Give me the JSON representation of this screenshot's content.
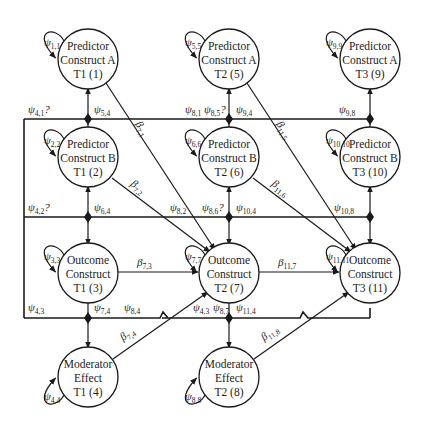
{
  "nodes": [
    {
      "id": 1,
      "lines": [
        "Predictor",
        "Construct A",
        "T1 (1)"
      ],
      "var": "1,1"
    },
    {
      "id": 5,
      "lines": [
        "Predictor",
        "Construct A",
        "T2 (5)"
      ],
      "var": "5,5"
    },
    {
      "id": 9,
      "lines": [
        "Predictor",
        "Construct A",
        "T3 (9)"
      ],
      "var": "9,9"
    },
    {
      "id": 2,
      "lines": [
        "Predictor",
        "Construct B",
        "T1 (2)"
      ],
      "var": "2,2"
    },
    {
      "id": 6,
      "lines": [
        "Predictor",
        "Construct B",
        "T2 (6)"
      ],
      "var": "6,6"
    },
    {
      "id": 10,
      "lines": [
        "Predictor",
        "Construct B",
        "T3 (10)"
      ],
      "var": "10,10"
    },
    {
      "id": 3,
      "lines": [
        "Outcome",
        "Construct",
        "T1 (3)"
      ],
      "var": "3,3"
    },
    {
      "id": 7,
      "lines": [
        "Outcome",
        "Construct",
        "T2 (7)"
      ],
      "var": "7,7"
    },
    {
      "id": 11,
      "lines": [
        "Outcome",
        "Construct",
        "T3 (11)"
      ],
      "var": "11,11"
    },
    {
      "id": 4,
      "lines": [
        "Moderator",
        "Effect",
        "T1 (4)"
      ],
      "var": "4,4"
    },
    {
      "id": 8,
      "lines": [
        "Moderator",
        "Effect",
        "T2 (8)"
      ],
      "var": "8,8"
    }
  ],
  "covariance_labels": [
    {
      "sym": "ψ",
      "sub": "4,1",
      "suffix": "?"
    },
    {
      "sym": "ψ",
      "sub": "5,4",
      "suffix": ""
    },
    {
      "sym": "ψ",
      "sub": "8,1",
      "suffix": ""
    },
    {
      "sym": "ψ",
      "sub": "8,5",
      "suffix": "?"
    },
    {
      "sym": "ψ",
      "sub": "9,4",
      "suffix": ""
    },
    {
      "sym": "ψ",
      "sub": "9,8",
      "suffix": ""
    },
    {
      "sym": "ψ",
      "sub": "4,2",
      "suffix": "?"
    },
    {
      "sym": "ψ",
      "sub": "6,4",
      "suffix": ""
    },
    {
      "sym": "ψ",
      "sub": "8,2",
      "suffix": ""
    },
    {
      "sym": "ψ",
      "sub": "8,6",
      "suffix": "?"
    },
    {
      "sym": "ψ",
      "sub": "10,4",
      "suffix": ""
    },
    {
      "sym": "ψ",
      "sub": "10,8",
      "suffix": ""
    },
    {
      "sym": "ψ",
      "sub": "4,3",
      "suffix": ""
    },
    {
      "sym": "ψ",
      "sub": "7,4",
      "suffix": ""
    },
    {
      "sym": "ψ",
      "sub": "8,4",
      "suffix": ""
    },
    {
      "sym": "ψ",
      "sub": "4,3",
      "suffix": ""
    },
    {
      "sym": "ψ",
      "sub": "8,7",
      "suffix": ""
    },
    {
      "sym": "ψ",
      "sub": "11,4",
      "suffix": ""
    }
  ],
  "path_labels": [
    {
      "sym": "β",
      "sub": "7,1"
    },
    {
      "sym": "β",
      "sub": "7,2"
    },
    {
      "sym": "β",
      "sub": "11,5"
    },
    {
      "sym": "β",
      "sub": "11,6"
    },
    {
      "sym": "β",
      "sub": "7,3"
    },
    {
      "sym": "β",
      "sub": "11,7"
    },
    {
      "sym": "β",
      "sub": "7,4"
    },
    {
      "sym": "β",
      "sub": "11,8"
    }
  ],
  "variance_symbol": "ψ"
}
